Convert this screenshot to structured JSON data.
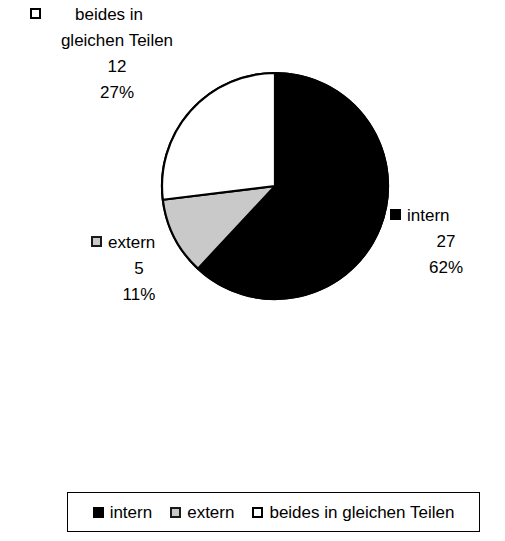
{
  "chart_data": {
    "type": "pie",
    "title": "",
    "subtitle": "",
    "xlabel": "",
    "ylabel": "",
    "grid": false,
    "legend_position": "bottom",
    "total": 44,
    "start_angle_deg": 0,
    "direction": "clockwise",
    "categories": [
      "intern",
      "extern",
      "beides in gleichen Teilen"
    ],
    "values": [
      27,
      5,
      12
    ],
    "percent_labels": [
      "62%",
      "11%",
      "27%"
    ],
    "percents": [
      62,
      11,
      27
    ],
    "colors": [
      "#000000",
      "#c9c9c9",
      "#ffffff"
    ],
    "slices": [
      {
        "name": "intern",
        "value": 27,
        "percent_label": "62%",
        "color": "#000000",
        "marker": "black-square-marker",
        "start_deg": 0,
        "end_deg": 223
      },
      {
        "name": "extern",
        "value": 5,
        "percent_label": "11%",
        "color": "#c9c9c9",
        "marker": "gray-square-marker",
        "start_deg": 223,
        "end_deg": 263
      },
      {
        "name": "beides in gleichen Teilen",
        "value": 12,
        "percent_label": "27%",
        "color": "#ffffff",
        "marker": "white-square-marker",
        "start_deg": 263,
        "end_deg": 360
      }
    ]
  },
  "labels": {
    "beides": {
      "name_line1": "beides in",
      "name_line2": "gleichen Teilen",
      "value": "12",
      "percent": "27%"
    },
    "intern": {
      "name": "intern",
      "value": "27",
      "percent": "62%"
    },
    "extern": {
      "name": "extern",
      "value": "5",
      "percent": "11%"
    }
  },
  "legend": {
    "items": [
      {
        "label": "intern",
        "swatch": "black-square-marker",
        "color": "#000000"
      },
      {
        "label": "extern",
        "swatch": "gray-square-marker",
        "color": "#c9c9c9"
      },
      {
        "label": "beides in gleichen Teilen",
        "swatch": "white-square-marker",
        "color": "#ffffff"
      }
    ]
  },
  "geometry": {
    "center_x": 275,
    "center_y": 186,
    "radius": 113
  }
}
